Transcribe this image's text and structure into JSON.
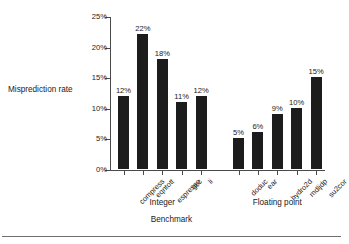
{
  "chart_data": {
    "type": "bar",
    "title": "",
    "xlabel": "Benchmark",
    "ylabel": "Misprediction rate",
    "categories": [
      "compress",
      "eqntott",
      "espresso",
      "gcc",
      "li",
      "doduc",
      "ear",
      "hydro2d",
      "mdljdp",
      "su2cor"
    ],
    "values": [
      12,
      22,
      18,
      11,
      12,
      5,
      6,
      9,
      10,
      15
    ],
    "value_labels": [
      "12%",
      "22%",
      "18%",
      "11%",
      "12%",
      "5%",
      "6%",
      "9%",
      "10%",
      "15%"
    ],
    "groups": [
      {
        "label": "Integer",
        "categories": [
          "compress",
          "eqntott",
          "espresso",
          "gcc",
          "li"
        ]
      },
      {
        "label": "Floating point",
        "categories": [
          "doduc",
          "ear",
          "hydro2d",
          "mdljdp",
          "su2cor"
        ]
      }
    ],
    "ylim": [
      0,
      25
    ],
    "ytick_values": [
      0,
      5,
      10,
      15,
      20,
      25
    ],
    "ytick_labels": [
      "0%",
      "5%",
      "10%",
      "15%",
      "20%",
      "25%"
    ],
    "grid": false,
    "legend": null,
    "bar_color": "#1c1c1c",
    "axis_color": "#4a4a4a"
  }
}
